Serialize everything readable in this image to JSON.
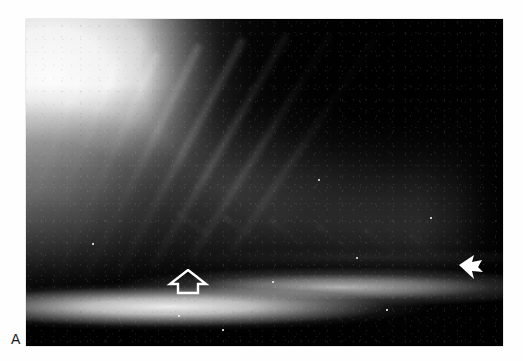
{
  "figure": {
    "panel_label": "A",
    "modality": "radiograph",
    "view": "lateral thoracic radiograph",
    "background_color": "#ffffff"
  },
  "radiograph": {
    "name": "lateral-thoracic-radiograph",
    "frame": {
      "x": 26,
      "y": 19,
      "width": 477,
      "height": 327
    },
    "film_base_color": "#050505",
    "highlight_color": "#ffffff",
    "regions": [
      {
        "id": "soft-tissue-cranial",
        "label": "cranial soft tissue / shoulder musculature",
        "tone": "bright"
      },
      {
        "id": "soft-tissue-ventral-left",
        "label": "ventral left soft tissue",
        "tone": "bright"
      },
      {
        "id": "thorax-haze",
        "label": "mid thoracic soft tissue haze",
        "tone": "mid-grey"
      },
      {
        "id": "caudal-haze",
        "label": "caudal thoracic soft tissue",
        "tone": "mid-grey"
      },
      {
        "id": "lung-field-dark",
        "label": "aerated dorsocaudal lung field",
        "tone": "dark"
      },
      {
        "id": "ventral-dark-band",
        "label": "ventral black band",
        "tone": "dark"
      },
      {
        "id": "sternum-band",
        "label": "sternal / diaphragmatic bright band",
        "tone": "bright"
      },
      {
        "id": "diaphragm-line",
        "label": "diaphragmatic crus line",
        "tone": "bright"
      }
    ],
    "vertebrae": [
      {
        "i": 0,
        "x": 0,
        "y": 248,
        "w": 42,
        "h": 40
      },
      {
        "i": 1,
        "x": 40,
        "y": 224,
        "w": 42,
        "h": 40
      },
      {
        "i": 2,
        "x": 80,
        "y": 200,
        "w": 43,
        "h": 41
      },
      {
        "i": 3,
        "x": 121,
        "y": 176,
        "w": 43,
        "h": 41
      },
      {
        "i": 4,
        "x": 162,
        "y": 152,
        "w": 42,
        "h": 40
      },
      {
        "i": 5,
        "x": 202,
        "y": 129,
        "w": 41,
        "h": 39
      },
      {
        "i": 6,
        "x": 241,
        "y": 107,
        "w": 40,
        "h": 38
      },
      {
        "i": 7,
        "x": 279,
        "y": 86,
        "w": 38,
        "h": 36
      }
    ],
    "ribs": [
      {
        "i": 0,
        "x": 48,
        "y": 58,
        "len": 250,
        "thick": 11,
        "rot": 70
      },
      {
        "i": 1,
        "x": 86,
        "y": 44,
        "len": 258,
        "thick": 11,
        "rot": 68
      },
      {
        "i": 2,
        "x": 126,
        "y": 34,
        "len": 262,
        "thick": 11,
        "rot": 66
      },
      {
        "i": 3,
        "x": 168,
        "y": 26,
        "len": 266,
        "thick": 11,
        "rot": 64
      },
      {
        "i": 4,
        "x": 212,
        "y": 20,
        "len": 268,
        "thick": 11,
        "rot": 62
      },
      {
        "i": 5,
        "x": 256,
        "y": 16,
        "len": 268,
        "thick": 10,
        "rot": 60
      },
      {
        "i": 6,
        "x": 300,
        "y": 16,
        "len": 264,
        "thick": 10,
        "rot": 58
      },
      {
        "i": 7,
        "x": 344,
        "y": 20,
        "len": 256,
        "thick": 10,
        "rot": 56
      }
    ],
    "artifact_spots": [
      {
        "x": 292,
        "y": 160,
        "d": 2.4
      },
      {
        "x": 246,
        "y": 262,
        "d": 2.0
      },
      {
        "x": 330,
        "y": 238,
        "d": 1.8
      },
      {
        "x": 152,
        "y": 296,
        "d": 1.8
      },
      {
        "x": 66,
        "y": 224,
        "d": 1.6
      },
      {
        "x": 404,
        "y": 198,
        "d": 1.6
      },
      {
        "x": 196,
        "y": 310,
        "d": 1.6
      },
      {
        "x": 360,
        "y": 290,
        "d": 1.5
      }
    ]
  },
  "annotations": [
    {
      "id": "open-arrow",
      "name": "open-arrow-marker",
      "style": "open outline arrow",
      "direction": "up",
      "color": "#ffffff",
      "tip": {
        "x": 187,
        "y": 270
      },
      "description": "open arrow indicating ventral lesion at the sternal border"
    },
    {
      "id": "solid-arrow",
      "name": "solid-arrow-marker",
      "style": "solid filled arrow",
      "direction": "left",
      "color": "#ffffff",
      "tip": {
        "x": 460,
        "y": 268
      },
      "description": "solid arrow indicating caudal diaphragmatic margin"
    }
  ]
}
